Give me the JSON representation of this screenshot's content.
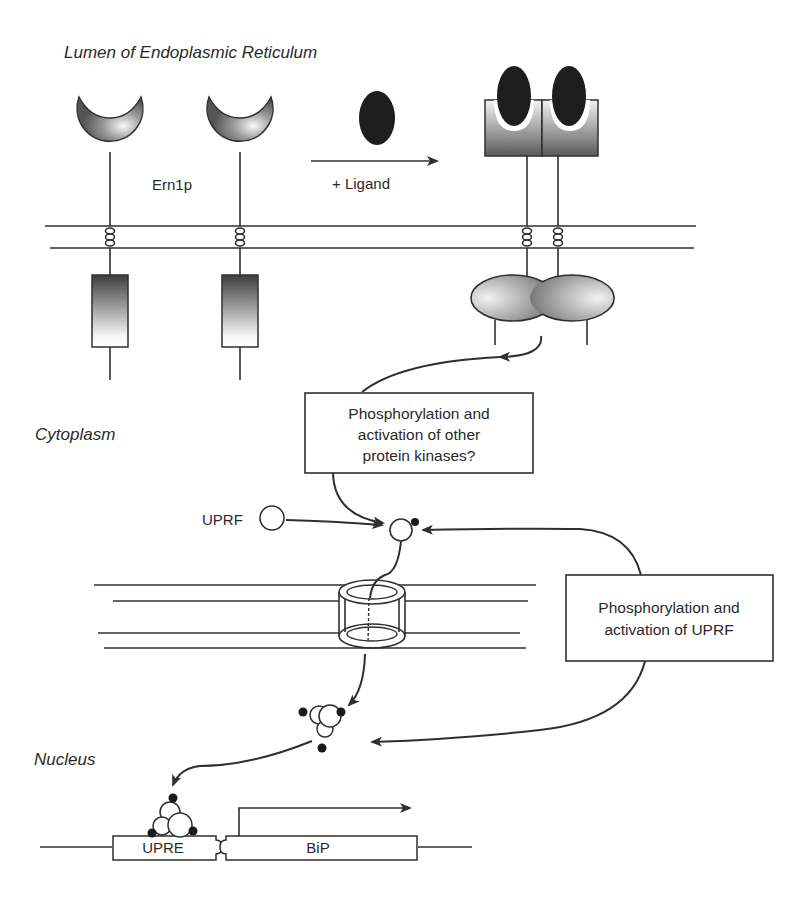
{
  "figure": {
    "regions": {
      "lumen": "Lumen of Endoplasmic Reticulum",
      "cytoplasm": "Cytoplasm",
      "nucleus": "Nucleus"
    },
    "labels": {
      "receptor": "Ern1p",
      "ligand_step": "+ Ligand",
      "factor": "UPRF",
      "promoter_element": "UPRE",
      "gene": "BiP"
    },
    "boxes": {
      "kinase_box": [
        "Phosphorylation and",
        "activation of other",
        "protein kinases?"
      ],
      "uprf_box": [
        "Phosphorylation and",
        "activation of UPRF"
      ]
    },
    "colors": {
      "line": "#2f2f2f",
      "ligand": "#1e1e1e",
      "protein_dark": "#4a4a4a",
      "protein_light": "#f2f2f2",
      "phospho_dot": "#1a1a1a"
    }
  }
}
